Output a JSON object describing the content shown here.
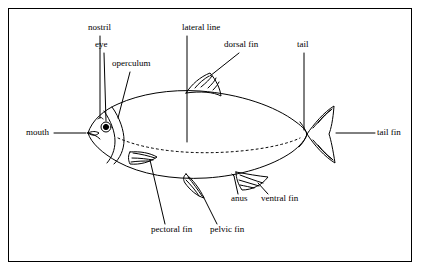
{
  "diagram": {
    "title": "",
    "line_color": "#000000",
    "background": "#ffffff",
    "labels": [
      {
        "id": "nostril",
        "text": "nostril",
        "x": 88,
        "y": 28
      },
      {
        "id": "eye",
        "text": "eye",
        "x": 97,
        "y": 45
      },
      {
        "id": "operculum",
        "text": "operculum",
        "x": 112,
        "y": 64
      },
      {
        "id": "lateral-line",
        "text": "lateral line",
        "x": 183,
        "y": 28
      },
      {
        "id": "dorsal-fin",
        "text": "dorsal fin",
        "x": 225,
        "y": 45
      },
      {
        "id": "tail",
        "text": "tail",
        "x": 298,
        "y": 45
      },
      {
        "id": "mouth",
        "text": "mouth",
        "x": 26,
        "y": 133
      },
      {
        "id": "tail-fin",
        "text": "tail fin",
        "x": 378,
        "y": 133
      },
      {
        "id": "anus",
        "text": "anus",
        "x": 232,
        "y": 199
      },
      {
        "id": "ventral-fin",
        "text": "ventral fin",
        "x": 262,
        "y": 199
      },
      {
        "id": "pectoral-fin",
        "text": "pectoral fin",
        "x": 152,
        "y": 230
      },
      {
        "id": "pelvic-fin",
        "text": "pelvic fin",
        "x": 211,
        "y": 230
      }
    ]
  }
}
